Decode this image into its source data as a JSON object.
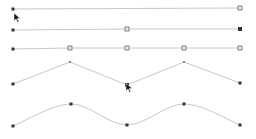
{
  "canvas": {
    "width": 256,
    "height": 139,
    "background": "#ffffff"
  },
  "colors": {
    "line": "#c8c8c8",
    "node_dark": "#333333",
    "node_hollow_stroke": "#666666",
    "node_hollow_fill": "#e8e8e8",
    "cursor": "#1a1a1a"
  },
  "rows": [
    {
      "id": "row-1-straight-two-point",
      "type": "straight",
      "points": [
        [
          13,
          9
        ],
        [
          240,
          8
        ]
      ],
      "markers": [
        "dot-dark",
        "square-hollow"
      ]
    },
    {
      "id": "row-2-straight-midpoint",
      "type": "straight",
      "points": [
        [
          13,
          30
        ],
        [
          127,
          29
        ],
        [
          240,
          29
        ]
      ],
      "markers": [
        "dot-dark",
        "square-hollow",
        "square-dark"
      ]
    },
    {
      "id": "row-3-straight-subdivided",
      "type": "straight",
      "points": [
        [
          13,
          49
        ],
        [
          70,
          48
        ],
        [
          127,
          48
        ],
        [
          184,
          48
        ],
        [
          240,
          48
        ]
      ],
      "markers": [
        "dot-dark",
        "square-hollow",
        "square-hollow",
        "square-hollow",
        "square-hollow"
      ]
    },
    {
      "id": "row-4-zigzag",
      "type": "polyline",
      "points": [
        [
          13,
          84
        ],
        [
          70,
          62
        ],
        [
          127,
          85
        ],
        [
          184,
          62
        ],
        [
          240,
          83
        ]
      ],
      "markers": [
        "dot-dark",
        "tick",
        "square-dark",
        "tick",
        "dot-dark"
      ]
    },
    {
      "id": "row-5-smooth",
      "type": "smooth",
      "points": [
        [
          13,
          126
        ],
        [
          71,
          104
        ],
        [
          127,
          125
        ],
        [
          184,
          104
        ],
        [
          240,
          125
        ]
      ],
      "markers": [
        "dot-dark",
        "dot-dark",
        "dot-dark",
        "dot-dark",
        "dot-dark"
      ]
    }
  ],
  "cursors": [
    {
      "id": "cursor-1",
      "x": 14,
      "y": 13
    },
    {
      "id": "cursor-2",
      "x": 126,
      "y": 83
    }
  ]
}
